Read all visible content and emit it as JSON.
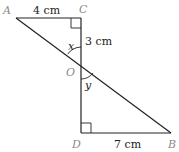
{
  "diagram": {
    "points": {
      "A": {
        "label": "A",
        "x": 16,
        "y": 18
      },
      "C": {
        "label": "C",
        "x": 81,
        "y": 18
      },
      "O": {
        "label": "O",
        "x": 81,
        "y": 64
      },
      "D": {
        "label": "D",
        "x": 81,
        "y": 133
      },
      "B": {
        "label": "B",
        "x": 171,
        "y": 133
      }
    },
    "measurements": {
      "AC": "4 cm",
      "CO": "3 cm",
      "DB": "7 cm"
    },
    "angles": {
      "x": "x",
      "y": "y"
    },
    "right_angles": [
      "C",
      "D"
    ],
    "colors": {
      "line": "#222222",
      "point_label": "#8a8a8a"
    }
  }
}
